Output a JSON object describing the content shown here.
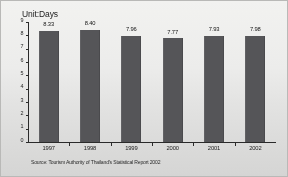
{
  "chart_data": {
    "type": "bar",
    "title": "",
    "unit_label": "Unit:Days",
    "xlabel": "",
    "ylabel": "",
    "categories": [
      "1997",
      "1998",
      "1999",
      "2000",
      "2001",
      "2002"
    ],
    "values": [
      8.33,
      8.4,
      7.96,
      7.77,
      7.93,
      7.98
    ],
    "value_labels": [
      "8.33",
      "8.40",
      "7.96",
      "7.77",
      "7.93",
      "7.98"
    ],
    "ylim": [
      0,
      9
    ],
    "y_ticks": [
      0,
      1,
      2,
      3,
      4,
      5,
      6,
      7,
      8,
      9
    ],
    "y_tick_labels": [
      "0",
      "1",
      "2",
      "3",
      "4",
      "5",
      "6",
      "7",
      "8",
      "9"
    ],
    "grid": false,
    "legend": false,
    "bar_color": "#555558",
    "source": "Source: Tourism Authority of Thailand's Statistical Report 2002"
  }
}
